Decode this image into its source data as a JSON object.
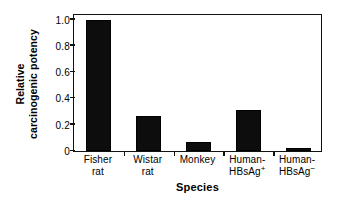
{
  "chart_data": {
    "type": "bar",
    "title": "",
    "subtitle": "",
    "xlabel": "Species",
    "ylabel": "Relative carcinogenic potency",
    "ylabel_lines": [
      "Relative",
      "carcinogenic potency"
    ],
    "categories": [
      "Fisher rat",
      "Wistar rat",
      "Monkey",
      "Human-HBsAg+",
      "Human-HBsAg-"
    ],
    "category_lines": [
      {
        "line1": "Fisher",
        "line2": "rat",
        "sup": ""
      },
      {
        "line1": "Wistar",
        "line2": "rat",
        "sup": ""
      },
      {
        "line1": "Monkey",
        "line2": "",
        "sup": ""
      },
      {
        "line1": "Human-",
        "line2": "HBsAg",
        "sup": "+"
      },
      {
        "line1": "Human-",
        "line2": "HBsAg",
        "sup": "−"
      }
    ],
    "values": [
      1.0,
      0.265,
      0.07,
      0.31,
      0.02
    ],
    "ylim": [
      0,
      1.05
    ],
    "yticks": [
      0,
      0.2,
      0.4,
      0.6,
      0.8,
      1.0
    ],
    "ytick_labels": [
      "0",
      "0.2",
      "0.4",
      "0.6",
      "0.8",
      "1.0"
    ],
    "grid": false,
    "legend": false,
    "legend_position": "none",
    "bar_color": "#0d0d0d",
    "axis_color": "#111111",
    "background_color": "#ffffff"
  }
}
